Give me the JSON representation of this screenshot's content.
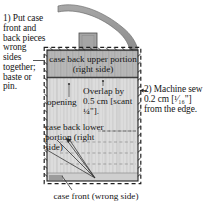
{
  "figure": {
    "steps": {
      "step1": "1) Put case front and back pieces wrong sides together; baste or pin.",
      "step2": "2) Machine sew 0.2 cm [¹⁄₁₆\"] from the edge."
    },
    "labels": {
      "case_back_upper": "case back upper portion (right side)",
      "opening": "opening",
      "overlap": "Overlap by 0.5 cm [scant ¼\"].",
      "case_back_lower": "case back lower portion (right side)",
      "case_front": "case front (wrong side)"
    },
    "colors": {
      "fabric_upper": "#b6b6b6",
      "fabric_lower": "#d9d9d9",
      "strap": "#9d9d9d",
      "outline": "#222222",
      "background": "#ffffff",
      "text": "#161616"
    },
    "measurements": {
      "seam_allowance_metric": "0.2 cm",
      "seam_allowance_imperial": "¹⁄₁₆\"",
      "overlap_metric": "0.5 cm",
      "overlap_imperial": "scant ¼\""
    }
  }
}
